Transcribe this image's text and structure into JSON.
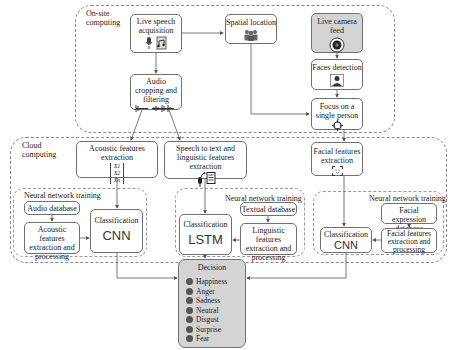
{
  "regions": {
    "onsite": "On-site\ncomputing",
    "cloud": "Cloud\ncomputing"
  },
  "onsite": {
    "live_speech": "Live speech acquisition",
    "audio_crop": "Audio cropping and filtering",
    "spatial": "Spatial location",
    "camera": "Live camera feed",
    "faces": "Faces detection",
    "focus": "Focus on a single person"
  },
  "cloud": {
    "acoustic_extraction": "Acoustic features extraction",
    "vector": [
      "X1",
      "X2",
      "Xn"
    ],
    "speech_to_text": "Speech to text and linguistic features extraction",
    "facial_extraction": "Facial features extraction",
    "audio_branch": {
      "training_label": "Neural network training",
      "database": "Audio database",
      "processing": "Acoustic features extraction and processing",
      "classification": "Classification",
      "model": "CNN"
    },
    "text_branch": {
      "training_label": "Neural network training",
      "database": "Textual database",
      "processing": "Linguistic features extraction and processing",
      "classification": "Classification",
      "model": "LSTM"
    },
    "face_branch": {
      "training_label": "Neural network training",
      "database": "Facial expression database",
      "processing": "Facial features extraction and processing",
      "classification": "Classification",
      "model": "CNN"
    }
  },
  "decision": {
    "title": "Decision",
    "emotions": [
      "Happiness",
      "Anger",
      "Sadness",
      "Neutral",
      "Disgust",
      "Surprise",
      "Fear"
    ]
  },
  "colors": {
    "box_border": "#707070",
    "region_border": "#8a8a8a",
    "highlight_fill": "#d4d4d4",
    "arrow": "#555555"
  }
}
